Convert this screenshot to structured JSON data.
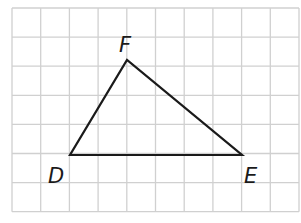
{
  "grid": {
    "cols": 10,
    "rows": 7,
    "x0": 12,
    "y0": 8,
    "cell_w": 28.7,
    "cell_h": 29.1,
    "line_color": "#d0d0d0"
  },
  "triangle": {
    "stroke": "#1a1a1a",
    "vertices": {
      "D": {
        "x": 70,
        "y": 155,
        "label": "D"
      },
      "E": {
        "x": 242,
        "y": 155,
        "label": "E"
      },
      "F": {
        "x": 127,
        "y": 60,
        "label": "F"
      }
    }
  },
  "labels": {
    "D": "D",
    "E": "E",
    "F": "F"
  }
}
